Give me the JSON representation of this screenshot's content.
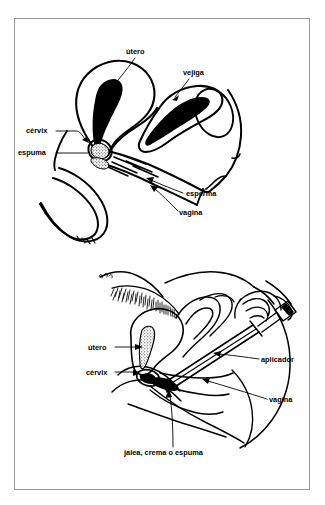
{
  "page": {
    "background_color": "#ffffff",
    "ink_color": "#000000",
    "frame_color": "#9a9a9a",
    "width": 325,
    "height": 505
  },
  "figures": [
    {
      "id": "figure-top",
      "name": "corte-sagital-espuma-en-cervix",
      "description": "Corte sagital de la pelvis femenina mostrando la espuma en el cuello uterino bloqueando el esperma",
      "labels": [
        {
          "key": "utero",
          "text": "útero",
          "x": 126,
          "y": 54,
          "anchor": "start"
        },
        {
          "key": "vejiga",
          "text": "vejiga",
          "x": 183,
          "y": 75,
          "anchor": "start"
        },
        {
          "key": "cervix",
          "text": "cérvix",
          "x": 26,
          "y": 133,
          "anchor": "start"
        },
        {
          "key": "espuma",
          "text": "espuma",
          "x": 18,
          "y": 155,
          "anchor": "start"
        },
        {
          "key": "esperma",
          "text": "esperma",
          "x": 186,
          "y": 196,
          "anchor": "start"
        },
        {
          "key": "vagina",
          "text": "vagina",
          "x": 179,
          "y": 215,
          "anchor": "start"
        }
      ]
    },
    {
      "id": "figure-bottom",
      "name": "aplicacion-del-aplicador-vaginal",
      "description": "Mujer recostada insertando un aplicador con jalea, crema o espuma en la vagina",
      "labels": [
        {
          "key": "utero",
          "text": "útero",
          "x": 88,
          "y": 350,
          "anchor": "start"
        },
        {
          "key": "cervix",
          "text": "cérvix",
          "x": 86,
          "y": 375,
          "anchor": "start"
        },
        {
          "key": "aplicador",
          "text": "aplicador",
          "x": 261,
          "y": 362,
          "anchor": "start"
        },
        {
          "key": "vagina",
          "text": "vagina",
          "x": 269,
          "y": 402,
          "anchor": "start"
        },
        {
          "key": "caption",
          "text": "jalea, crema o espuma",
          "x": 124,
          "y": 455,
          "anchor": "start"
        }
      ]
    }
  ]
}
